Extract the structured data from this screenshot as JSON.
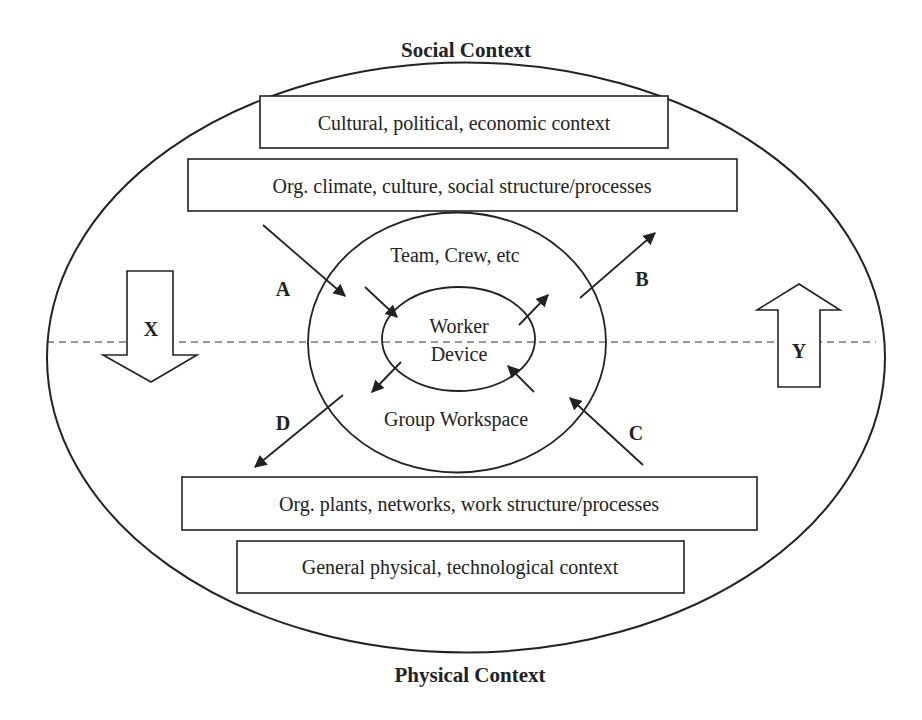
{
  "diagram": {
    "top_label": "Social Context",
    "bottom_label": "Physical Context",
    "boxes": [
      {
        "id": "cultural",
        "label": "Cultural, political, economic context"
      },
      {
        "id": "org_climate",
        "label": "Org. climate, culture, social structure/processes"
      },
      {
        "id": "org_plants",
        "label": "Org. plants, networks, work structure/processes"
      },
      {
        "id": "general_physical",
        "label": "General physical, technological context"
      }
    ],
    "middle_ellipse": {
      "top_label": "Team, Crew, etc",
      "bottom_label": "Group Workspace"
    },
    "inner_ellipse": {
      "top_label": "Worker",
      "bottom_label": "Device"
    },
    "arrow_labels": {
      "a": "A",
      "b": "B",
      "c": "C",
      "d": "D"
    },
    "block_arrows": {
      "x": {
        "label": "X",
        "direction": "down"
      },
      "y": {
        "label": "Y",
        "direction": "up"
      }
    },
    "colors": {
      "stroke": "#222222",
      "background": "#ffffff"
    }
  }
}
